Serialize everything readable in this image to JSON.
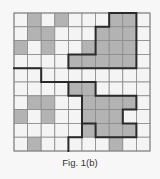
{
  "figure": {
    "caption": "Fig. 1(b)",
    "grid": {
      "rows": 10,
      "cols": 10,
      "shaded_cells": [
        [
          0,
          1
        ],
        [
          0,
          3
        ],
        [
          0,
          7
        ],
        [
          0,
          8
        ],
        [
          1,
          1
        ],
        [
          1,
          2
        ],
        [
          1,
          6
        ],
        [
          1,
          7
        ],
        [
          1,
          8
        ],
        [
          2,
          0
        ],
        [
          2,
          2
        ],
        [
          2,
          5
        ],
        [
          2,
          6
        ],
        [
          2,
          7
        ],
        [
          2,
          8
        ],
        [
          3,
          4
        ],
        [
          3,
          5
        ],
        [
          3,
          6
        ],
        [
          3,
          7
        ],
        [
          3,
          8
        ],
        [
          5,
          4
        ],
        [
          5,
          5
        ],
        [
          6,
          1
        ],
        [
          6,
          2
        ],
        [
          6,
          5
        ],
        [
          6,
          6
        ],
        [
          6,
          7
        ],
        [
          6,
          8
        ],
        [
          7,
          0
        ],
        [
          7,
          2
        ],
        [
          7,
          5
        ],
        [
          7,
          6
        ],
        [
          7,
          7
        ],
        [
          8,
          5
        ],
        [
          8,
          6
        ],
        [
          8,
          7
        ],
        [
          8,
          8
        ],
        [
          9,
          1
        ],
        [
          9,
          7
        ]
      ],
      "thick_paths": [
        [
          [
            7,
            0
          ],
          [
            9,
            0
          ],
          [
            9,
            4
          ],
          [
            4,
            4
          ],
          [
            4,
            3
          ],
          [
            6,
            3
          ],
          [
            6,
            1
          ],
          [
            7,
            1
          ],
          [
            7,
            0
          ]
        ],
        [
          [
            0,
            4
          ],
          [
            2,
            4
          ],
          [
            2,
            5
          ],
          [
            6,
            5
          ],
          [
            6,
            6
          ],
          [
            9,
            6
          ],
          [
            9,
            7
          ],
          [
            8,
            7
          ],
          [
            8,
            8
          ],
          [
            9,
            8
          ],
          [
            9,
            9
          ],
          [
            6,
            9
          ],
          [
            6,
            8
          ],
          [
            5,
            8
          ]
        ],
        [
          [
            4,
            5
          ],
          [
            4,
            6
          ],
          [
            5,
            6
          ],
          [
            5,
            9
          ],
          [
            4,
            9
          ],
          [
            4,
            10
          ]
        ]
      ]
    },
    "colors": {
      "shade": "#b3b3b3",
      "empty": "#f4f4f4",
      "grid_line": "#8a8a8a",
      "thick_line": "#2a2a2a"
    }
  }
}
